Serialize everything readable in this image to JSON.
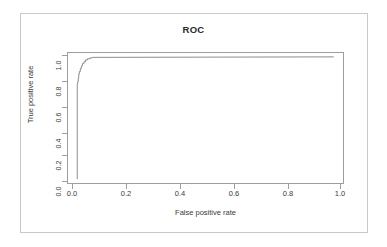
{
  "figure": {
    "title": "ROC",
    "frame_color": "#c9c9c9",
    "axis_color": "#9e9e9e",
    "curve_color": "#8c8c8c",
    "text_color": "#3a3a3a"
  },
  "chart_data": {
    "type": "line",
    "title": "ROC",
    "xlabel": "False positive rate",
    "ylabel": "True positive rate",
    "xlim": [
      0.0,
      1.0
    ],
    "ylim": [
      0.0,
      1.0
    ],
    "grid": false,
    "legend": null,
    "xticks": [
      "0.0",
      "0.2",
      "0.4",
      "0.6",
      "0.8",
      "1.0"
    ],
    "xtickvalues": [
      0.0,
      0.2,
      0.4,
      0.6,
      0.8,
      1.0
    ],
    "yticks": [
      "0.0",
      "0.2",
      "0.4",
      "0.6",
      "0.8",
      "1.0"
    ],
    "ytickvalues": [
      0.0,
      0.2,
      0.4,
      0.6,
      0.8,
      1.0
    ],
    "series": [
      {
        "name": "ROC curve",
        "x": [
          0.0,
          0.0,
          0.002,
          0.002,
          0.004,
          0.004,
          0.006,
          0.006,
          0.008,
          0.008,
          0.012,
          0.012,
          0.016,
          0.016,
          0.02,
          0.02,
          0.026,
          0.026,
          0.032,
          0.032,
          0.04,
          0.04,
          0.05,
          0.05,
          0.06,
          0.06,
          0.5,
          1.0
        ],
        "y": [
          0.0,
          0.78,
          0.78,
          0.8,
          0.8,
          0.83,
          0.83,
          0.86,
          0.86,
          0.88,
          0.88,
          0.905,
          0.905,
          0.925,
          0.925,
          0.945,
          0.945,
          0.96,
          0.96,
          0.975,
          0.975,
          0.985,
          0.985,
          0.992,
          0.992,
          0.996,
          0.998,
          1.0
        ]
      }
    ]
  }
}
